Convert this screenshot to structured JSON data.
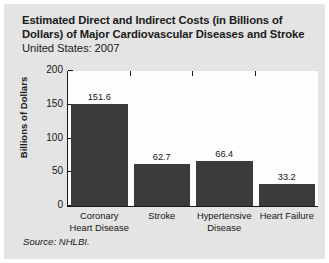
{
  "figure": {
    "title_lines": [
      "Estimated Direct and Indirect Costs (in Billions of",
      "Dollars) of Major Cardiovascular Diseases and Stroke"
    ],
    "subtitle": "United States: 2007",
    "source": "Source: NHLBI.",
    "background_color": "#e4e4e4",
    "plot_background_color": "#fdfdfd",
    "bar_color": "#3b3b3b",
    "axis_color": "#161616"
  },
  "chart_data": {
    "type": "bar",
    "title": "Estimated Direct and Indirect Costs (in Billions of Dollars) of Major Cardiovascular Diseases and Stroke",
    "subtitle": "United States: 2007",
    "categories": [
      "Coronary Heart Disease",
      "Stroke",
      "Hypertensive Disease",
      "Heart Failure"
    ],
    "category_lines": [
      [
        "Coronary",
        "Heart Disease"
      ],
      [
        "Stroke",
        ""
      ],
      [
        "Hypertensive",
        "Disease"
      ],
      [
        "Heart Failure",
        ""
      ]
    ],
    "values": [
      151.6,
      62.7,
      66.4,
      33.2
    ],
    "value_labels": [
      "151.6",
      "62.7",
      "66.4",
      "33.2"
    ],
    "xlabel": "",
    "ylabel": "Billions of Dollars",
    "ylim": [
      0,
      200
    ],
    "yticks": [
      200,
      150,
      100,
      50,
      0
    ],
    "ytick_labels": [
      "200",
      "150",
      "100",
      "50",
      "0"
    ],
    "grid": false,
    "legend": false,
    "source": "Source: NHLBI."
  }
}
